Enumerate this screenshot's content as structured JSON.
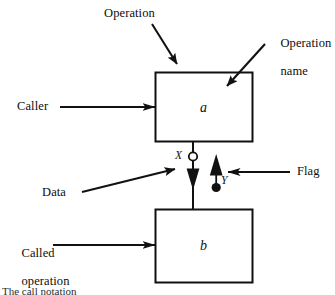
{
  "figure": {
    "boxes": [
      {
        "id": "a",
        "letter": "a",
        "x": 155,
        "y": 72,
        "w": 98,
        "h": 70
      },
      {
        "id": "b",
        "letter": "b",
        "x": 155,
        "y": 209,
        "w": 98,
        "h": 74
      }
    ],
    "annotations": {
      "operation": "Operation",
      "operation_name_line1": "Operation",
      "operation_name_line2": "name",
      "caller": "Caller",
      "called_line1": "Called",
      "called_line2": "operation",
      "data": "Data",
      "flag": "Flag"
    },
    "node_labels": {
      "data_port": "X",
      "flag_port": "Y"
    },
    "caption": "The call notation",
    "colors": {
      "stroke": "#111111",
      "fill": "#ffffff",
      "text": "#0d0d0d"
    }
  }
}
